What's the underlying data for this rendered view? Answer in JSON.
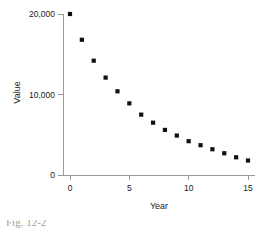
{
  "figure": {
    "caption_partial": "Fig. 12-2",
    "background_color": "#ffffff",
    "marker_color": "#111111",
    "axis_color": "#9a9a9a",
    "text_color": "#1a1a1a"
  },
  "chart_data": {
    "type": "scatter",
    "title": "",
    "xlabel": "Year",
    "ylabel": "Value",
    "xlim": [
      -0.7,
      15.7
    ],
    "ylim": [
      0,
      20800
    ],
    "xticks": [
      0,
      5,
      10,
      15
    ],
    "xtick_labels": [
      "0",
      "5",
      "10",
      "15"
    ],
    "yticks": [
      0,
      10000,
      20000
    ],
    "ytick_labels": [
      "0",
      "10,000",
      "20,000"
    ],
    "grid": false,
    "legend": false,
    "x": [
      0,
      1,
      2,
      3,
      4,
      5,
      6,
      7,
      8,
      9,
      10,
      11,
      12,
      13,
      14,
      15
    ],
    "values": [
      20000,
      16800,
      14200,
      12100,
      10400,
      8900,
      7500,
      6500,
      5600,
      4900,
      4200,
      3700,
      3200,
      2700,
      2200,
      1800
    ],
    "series": [
      {
        "name": "Value",
        "marker": "square",
        "values": [
          20000,
          16800,
          14200,
          12100,
          10400,
          8900,
          7500,
          6500,
          5600,
          4900,
          4200,
          3700,
          3200,
          2700,
          2200,
          1800
        ]
      }
    ]
  }
}
